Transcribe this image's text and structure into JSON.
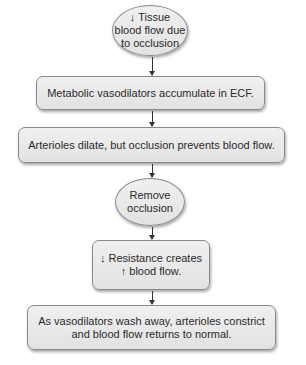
{
  "diagram": {
    "type": "flowchart",
    "nodes": [
      {
        "id": "n1",
        "shape": "ellipse",
        "arrow_prefix": "↓",
        "line1": "Tissue",
        "line2": "blood flow due",
        "line3": "to occlusion"
      },
      {
        "id": "n2",
        "shape": "box",
        "text": "Metabolic vasodilators accumulate in ECF."
      },
      {
        "id": "n3",
        "shape": "box",
        "text": "Arterioles dilate, but occlusion prevents blood flow."
      },
      {
        "id": "n4",
        "shape": "ellipse",
        "line1": "Remove",
        "line2": "occlusion"
      },
      {
        "id": "n5",
        "shape": "box",
        "arrow_prefix1": "↓",
        "line1": "Resistance creates",
        "arrow_prefix2": "↑",
        "line2": "blood flow."
      },
      {
        "id": "n6",
        "shape": "box",
        "line1": "As vasodilators wash away, arterioles constrict",
        "line2": "and blood flow returns to normal."
      }
    ],
    "edges": [
      {
        "from": "n1",
        "to": "n2"
      },
      {
        "from": "n2",
        "to": "n3"
      },
      {
        "from": "n3",
        "to": "n4"
      },
      {
        "from": "n4",
        "to": "n5"
      },
      {
        "from": "n5",
        "to": "n6"
      }
    ]
  }
}
